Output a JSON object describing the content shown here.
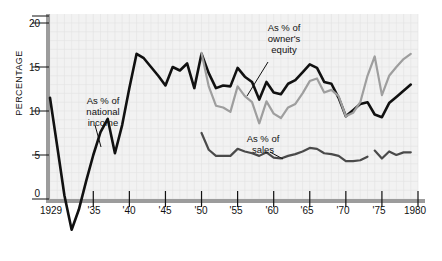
{
  "chart_data": {
    "type": "line",
    "title": "",
    "xlabel": "",
    "ylabel": "PERCENTAGE",
    "xlim": [
      1929,
      1980
    ],
    "ylim": [
      -4,
      21
    ],
    "grid": true,
    "legend_position": "inline-annotations",
    "y_ticks": [
      0,
      5,
      10,
      15,
      20
    ],
    "y_tick_labels": [
      "0",
      "5",
      "10",
      "15",
      "20"
    ],
    "x_ticks": [
      1929,
      1935,
      1940,
      1945,
      1950,
      1955,
      1960,
      1965,
      1970,
      1975,
      1980
    ],
    "x_tick_labels": [
      "1929",
      "'35",
      "'40",
      "'45",
      "'50",
      "'55",
      "'60",
      "'65",
      "'70",
      "'75",
      "1980"
    ],
    "annotations": [
      {
        "name": "national-income-label",
        "text": "As % of\nnational\nincome",
        "line1": "As % of",
        "line2": "national",
        "line3": "income"
      },
      {
        "name": "owners-equity-label",
        "text": "As % of\nowner's\nequity",
        "line1": "As % of",
        "line2": "owner's",
        "line3": "equity"
      },
      {
        "name": "sales-label",
        "text": "As % of\nsales",
        "line1": "As % of",
        "line2": "sales"
      }
    ],
    "series": [
      {
        "name": "As % of national income",
        "color": "#111111",
        "width": 2.6,
        "x": [
          1929,
          1930,
          1931,
          1932,
          1933,
          1934,
          1935,
          1936,
          1937,
          1938,
          1939,
          1940,
          1941,
          1942,
          1943,
          1944,
          1945,
          1946,
          1947,
          1948,
          1949,
          1950,
          1951,
          1952,
          1953,
          1954,
          1955,
          1956,
          1957,
          1958,
          1959,
          1960,
          1961,
          1962,
          1963,
          1964,
          1965,
          1966,
          1967,
          1968,
          1969,
          1970,
          1971,
          1972,
          1973,
          1974,
          1975,
          1976,
          1977,
          1978,
          1979
        ],
        "values": [
          11.5,
          6.0,
          0.4,
          -3.5,
          -1.2,
          2.0,
          5.0,
          7.6,
          9.1,
          5.2,
          8.4,
          12.6,
          16.5,
          16.0,
          15.0,
          14.0,
          12.9,
          15.0,
          14.6,
          15.4,
          12.6,
          16.5,
          14.3,
          12.6,
          12.9,
          12.8,
          14.9,
          13.9,
          13.3,
          11.3,
          13.3,
          12.1,
          11.9,
          13.1,
          13.5,
          14.4,
          15.3,
          14.9,
          13.3,
          13.1,
          11.5,
          9.4,
          10.1,
          10.8,
          11.0,
          9.6,
          9.3,
          10.9,
          11.6,
          12.3,
          13.0
        ]
      },
      {
        "name": "As % of owner's equity",
        "color": "#9e9e9e",
        "width": 2.2,
        "x": [
          1950,
          1951,
          1952,
          1953,
          1954,
          1955,
          1956,
          1957,
          1958,
          1959,
          1960,
          1961,
          1962,
          1963,
          1964,
          1965,
          1966,
          1967,
          1968,
          1969,
          1970,
          1971,
          1972,
          1973,
          1974,
          1975,
          1976,
          1977,
          1978,
          1979
        ],
        "values": [
          16.6,
          12.8,
          10.6,
          10.4,
          9.9,
          12.8,
          11.7,
          11.0,
          8.6,
          11.1,
          9.7,
          9.2,
          10.4,
          10.8,
          12.0,
          13.4,
          13.7,
          12.1,
          12.4,
          11.7,
          9.4,
          9.8,
          11.0,
          14.0,
          16.2,
          11.8,
          14.0,
          15.0,
          15.9,
          16.5
        ]
      },
      {
        "name": "As % of sales",
        "color": "#4a4a4a",
        "width": 2.2,
        "segments": [
          {
            "x": [
              1950,
              1951,
              1952,
              1953,
              1954,
              1955,
              1956,
              1957,
              1958,
              1959,
              1960,
              1961,
              1962,
              1963,
              1964,
              1965,
              1966,
              1967,
              1968,
              1969,
              1970,
              1971,
              1972,
              1973
            ],
            "values": [
              7.5,
              5.6,
              4.9,
              4.9,
              4.9,
              5.7,
              5.4,
              5.2,
              4.9,
              5.3,
              4.7,
              4.6,
              4.9,
              5.1,
              5.4,
              5.8,
              5.7,
              5.2,
              5.1,
              4.9,
              4.3,
              4.3,
              4.4,
              4.8
            ]
          },
          {
            "x": [
              1974,
              1975,
              1976,
              1977,
              1978,
              1979
            ],
            "values": [
              5.5,
              4.6,
              5.4,
              5.0,
              5.3,
              5.3
            ]
          }
        ]
      }
    ]
  },
  "plot": {
    "background": "#f2f2f2",
    "axis_color": "#9c9c9c",
    "grid_color": "#e2e2e2"
  }
}
